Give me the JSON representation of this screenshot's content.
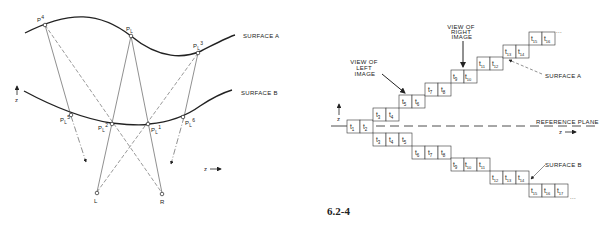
{
  "figure": {
    "number": "6.2-4"
  },
  "left_diagram": {
    "surface_a_label": "SURFACE A",
    "surface_b_label": "SURFACE B",
    "axis_vertical_label": "z",
    "axis_horizontal_label": "z",
    "points": [
      {
        "id": "P4",
        "base": "P",
        "sup": "4",
        "sub": "",
        "surface": "A"
      },
      {
        "id": "PL",
        "base": "P",
        "sup": "",
        "sub": "L",
        "surface": "A"
      },
      {
        "id": "PL3",
        "base": "P",
        "sup": "3",
        "sub": "L",
        "surface": "A"
      },
      {
        "id": "PL5",
        "base": "P",
        "sup": "5",
        "sub": "L",
        "surface": "B"
      },
      {
        "id": "PL2",
        "base": "P",
        "sup": "2",
        "sub": "L",
        "surface": "B"
      },
      {
        "id": "PL1",
        "base": "P",
        "sup": "1",
        "sub": "L",
        "surface": "B"
      },
      {
        "id": "PL6",
        "base": "P",
        "sup": "6",
        "sub": "L",
        "surface": "B"
      }
    ],
    "eyes": {
      "left": "L",
      "right": "R"
    }
  },
  "right_diagram": {
    "view_left_label": [
      "VIEW OF",
      "LEFT",
      "IMAGE"
    ],
    "view_right_label": [
      "VIEW OF",
      "RIGHT",
      "IMAGE"
    ],
    "surface_a_label": "SURFACE A",
    "surface_b_label": "SURFACE B",
    "reference_plane_label": "REFERENCE PLANE",
    "axis_vertical_label": "z",
    "axis_horizontal_label": "z",
    "ellipsis": "...",
    "surface_a_cells": [
      {
        "label": "t",
        "sub": "1"
      },
      {
        "label": "t",
        "sub": "2"
      },
      {
        "label": "t",
        "sub": "3"
      },
      {
        "label": "t",
        "sub": "4"
      },
      {
        "label": "t",
        "sub": "5"
      },
      {
        "label": "t",
        "sub": "6"
      },
      {
        "label": "t",
        "sub": "7"
      },
      {
        "label": "t",
        "sub": "8"
      },
      {
        "label": "t",
        "sub": "9"
      },
      {
        "label": "t",
        "sub": "10"
      },
      {
        "label": "t",
        "sub": "11"
      },
      {
        "label": "t",
        "sub": "12"
      },
      {
        "label": "t",
        "sub": "13"
      },
      {
        "label": "t",
        "sub": "14"
      },
      {
        "label": "t",
        "sub": "15"
      },
      {
        "label": "t",
        "sub": "16"
      }
    ],
    "surface_b_cells": [
      {
        "label": "t",
        "sub": "3"
      },
      {
        "label": "t",
        "sub": "4"
      },
      {
        "label": "t",
        "sub": "5"
      },
      {
        "label": "t",
        "sub": "6"
      },
      {
        "label": "t",
        "sub": "7"
      },
      {
        "label": "t",
        "sub": "8"
      },
      {
        "label": "t",
        "sub": "9"
      },
      {
        "label": "t",
        "sub": "10"
      },
      {
        "label": "t",
        "sub": "11"
      },
      {
        "label": "t",
        "sub": "12"
      },
      {
        "label": "t",
        "sub": "13"
      },
      {
        "label": "t",
        "sub": "14"
      },
      {
        "label": "t",
        "sub": "15"
      },
      {
        "label": "t",
        "sub": "16"
      },
      {
        "label": "t",
        "sub": "17"
      }
    ]
  }
}
